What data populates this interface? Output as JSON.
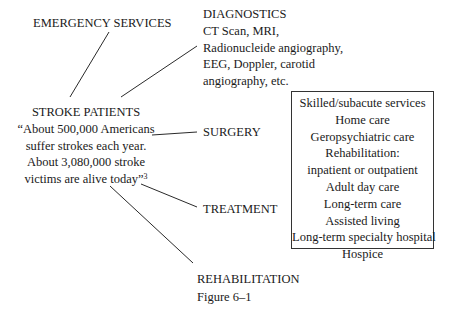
{
  "diagram": {
    "emergency": {
      "label": "EMERGENCY SERVICES"
    },
    "diagnostics": {
      "title": "DIAGNOSTICS",
      "lines": [
        "CT Scan, MRI,",
        "Radionucleide angiography,",
        "EEG, Doppler, carotid",
        "angiography, etc."
      ]
    },
    "stroke": {
      "title": "STROKE PATIENTS",
      "lines": [
        "“About 500,000 Americans",
        "suffer strokes each year.",
        "About 3,080,000 stroke",
        "victims are alive today”"
      ],
      "footnote": "3"
    },
    "surgery": {
      "label": "SURGERY"
    },
    "treatment": {
      "label": "TREATMENT"
    },
    "rehabilitation": {
      "label": "REHABILITATION"
    },
    "services_box": {
      "items": [
        "Skilled/subacute services",
        "Home care",
        "Geropsychiatric care",
        "Rehabilitation:",
        "inpatient or outpatient",
        "Adult day care",
        "Long-term care",
        "Assisted living",
        "Long-term specialty hospital",
        "Hospice"
      ]
    },
    "caption": "Figure 6–1",
    "line_color": "#2a2a2a"
  }
}
